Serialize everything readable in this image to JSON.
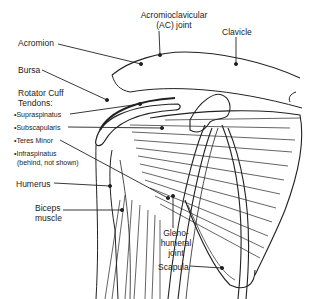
{
  "diagram": {
    "labels": {
      "acromioclavicular": "Acromioclavicular",
      "acromioclavicular_2": "(AC) joint",
      "clavicle": "Clavicle",
      "acromion": "Acromion",
      "bursa": "Bursa",
      "rotator_cuff": "Rotator Cuff",
      "tendons": "Tendons:",
      "supraspinatus": "•Supraspinatus",
      "subscapularis": "•Subscapularis",
      "teres_minor": "•Teres Minor",
      "infraspinatus": "•Infraspinatus",
      "infraspinatus_note": "(behind, not shown)",
      "humerus": "Humerus",
      "biceps_1": "Biceps",
      "biceps_2": "muscle",
      "gleno_1": "Gleno-",
      "gleno_2": "humeral",
      "gleno_3": "joint",
      "scapula": "Scapula"
    },
    "colors": {
      "ink": "#222222",
      "background": "#ffffff"
    }
  }
}
